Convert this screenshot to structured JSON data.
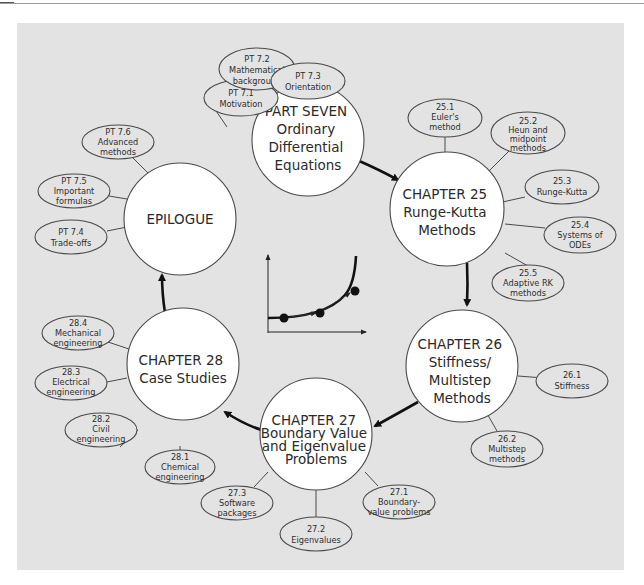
{
  "diagram": {
    "background_color": "#e3e3e3",
    "center_icon": "euler-method-curve-graph",
    "flow": [
      "part7",
      "ch25",
      "ch26",
      "ch27",
      "ch28",
      "epilogue"
    ],
    "nodes": {
      "part7": {
        "lines": [
          "PART SEVEN",
          "Ordinary",
          "Differential",
          "Equations"
        ],
        "children": [
          {
            "lines": [
              "PT 7.1",
              "Motivation"
            ]
          },
          {
            "lines": [
              "PT 7.2",
              "Mathematical",
              "background"
            ]
          },
          {
            "lines": [
              "PT 7.3",
              "Orientation"
            ]
          }
        ]
      },
      "ch25": {
        "lines": [
          "CHAPTER 25",
          "Runge-Kutta",
          "Methods"
        ],
        "children": [
          {
            "lines": [
              "25.1",
              "Euler's",
              "method"
            ]
          },
          {
            "lines": [
              "25.2",
              "Heun and",
              "midpoint",
              "methods"
            ]
          },
          {
            "lines": [
              "25.3",
              "Runge-Kutta"
            ]
          },
          {
            "lines": [
              "25.4",
              "Systems of",
              "ODEs"
            ]
          },
          {
            "lines": [
              "25.5",
              "Adaptive RK",
              "methods"
            ]
          }
        ]
      },
      "ch26": {
        "lines": [
          "CHAPTER 26",
          "Stiffness/",
          "Multistep",
          "Methods"
        ],
        "children": [
          {
            "lines": [
              "26.1",
              "Stiffness"
            ]
          },
          {
            "lines": [
              "26.2",
              "Multistep",
              "methods"
            ]
          }
        ]
      },
      "ch27": {
        "lines": [
          "CHAPTER 27",
          "Boundary Value",
          "and Eigenvalue",
          "Problems"
        ],
        "children": [
          {
            "lines": [
              "27.1",
              "Boundary-",
              "value problems"
            ]
          },
          {
            "lines": [
              "27.2",
              "Eigenvalues"
            ]
          },
          {
            "lines": [
              "27.3",
              "Software",
              "packages"
            ]
          }
        ]
      },
      "ch28": {
        "lines": [
          "CHAPTER 28",
          "Case Studies"
        ],
        "children": [
          {
            "lines": [
              "28.1",
              "Chemical",
              "engineering"
            ]
          },
          {
            "lines": [
              "28.2",
              "Civil",
              "engineering"
            ]
          },
          {
            "lines": [
              "28.3",
              "Electrical",
              "engineering"
            ]
          },
          {
            "lines": [
              "28.4",
              "Mechanical",
              "engineering"
            ]
          }
        ]
      },
      "epilogue": {
        "lines": [
          "EPILOGUE"
        ],
        "children": [
          {
            "lines": [
              "PT 7.4",
              "Trade-offs"
            ]
          },
          {
            "lines": [
              "PT 7.5",
              "Important",
              "formulas"
            ]
          },
          {
            "lines": [
              "PT 7.6",
              "Advanced",
              "methods"
            ]
          }
        ]
      }
    }
  }
}
